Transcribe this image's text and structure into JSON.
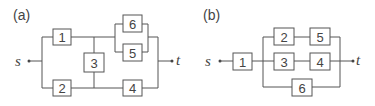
{
  "diagram_a": {
    "panel_label": "(a)",
    "source": "s",
    "sink": "t",
    "blocks": [
      {
        "id": "1",
        "label": "1"
      },
      {
        "id": "2",
        "label": "2"
      },
      {
        "id": "3",
        "label": "3"
      },
      {
        "id": "4",
        "label": "4"
      },
      {
        "id": "5",
        "label": "5"
      },
      {
        "id": "6",
        "label": "6"
      }
    ]
  },
  "diagram_b": {
    "panel_label": "(b)",
    "source": "s",
    "sink": "t",
    "blocks": [
      {
        "id": "1",
        "label": "1"
      },
      {
        "id": "2",
        "label": "2"
      },
      {
        "id": "3",
        "label": "3"
      },
      {
        "id": "4",
        "label": "4"
      },
      {
        "id": "5",
        "label": "5"
      },
      {
        "id": "6",
        "label": "6"
      }
    ]
  },
  "colors": {
    "line": "#555555",
    "text": "#444444",
    "background": "#ffffff"
  }
}
